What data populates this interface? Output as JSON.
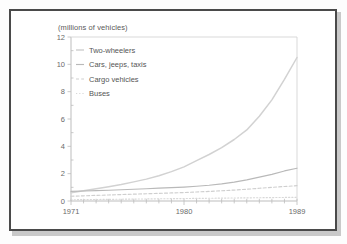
{
  "figure": {
    "title": "(millions of vehicles)",
    "frame_color": "#4a4a4a",
    "background": "#ffffff"
  },
  "legend": {
    "position": "top-left-inside",
    "items": [
      {
        "label": "Two-wheelers",
        "style": "solid",
        "color": "#d2d2d2"
      },
      {
        "label": "Cars, jeeps, taxis",
        "style": "solid",
        "color": "#b9b9b9"
      },
      {
        "label": "Cargo vehicles",
        "style": "dashed",
        "color": "#cfcfcf"
      },
      {
        "label": "Buses",
        "style": "dotted",
        "color": "#d8d8d8"
      }
    ]
  },
  "axes": {
    "y_ticks": [
      "0",
      "2",
      "4",
      "6",
      "8",
      "10",
      "12"
    ],
    "x_ticks": [
      "1971",
      "1980",
      "1989"
    ],
    "ylabel": "",
    "xlabel": ""
  },
  "chart_data": {
    "type": "line",
    "title": "(millions of vehicles)",
    "xlabel": "",
    "ylabel": "millions of vehicles",
    "xlim": [
      1971,
      1989
    ],
    "ylim": [
      0,
      12
    ],
    "yticks": [
      0,
      2,
      4,
      6,
      8,
      10,
      12
    ],
    "xticks": [
      1971,
      1980,
      1989
    ],
    "grid": false,
    "legend_position": "upper left",
    "x": [
      1971,
      1972,
      1973,
      1974,
      1975,
      1976,
      1977,
      1978,
      1979,
      1980,
      1981,
      1982,
      1983,
      1984,
      1985,
      1986,
      1987,
      1988,
      1989
    ],
    "series": [
      {
        "name": "Two-wheelers",
        "style": "solid",
        "values": [
          0.6,
          0.75,
          0.9,
          1.05,
          1.2,
          1.4,
          1.6,
          1.85,
          2.15,
          2.5,
          2.95,
          3.4,
          3.9,
          4.5,
          5.2,
          6.2,
          7.4,
          8.9,
          10.5
        ]
      },
      {
        "name": "Cars, jeeps, taxis",
        "style": "solid",
        "values": [
          0.7,
          0.73,
          0.76,
          0.79,
          0.82,
          0.86,
          0.9,
          0.94,
          0.98,
          1.02,
          1.08,
          1.15,
          1.25,
          1.38,
          1.55,
          1.75,
          1.95,
          2.2,
          2.4
        ]
      },
      {
        "name": "Cargo vehicles",
        "style": "dashed",
        "values": [
          0.35,
          0.38,
          0.41,
          0.44,
          0.47,
          0.5,
          0.53,
          0.56,
          0.59,
          0.62,
          0.66,
          0.7,
          0.75,
          0.8,
          0.86,
          0.93,
          1.0,
          1.06,
          1.12
        ]
      },
      {
        "name": "Buses",
        "style": "dotted",
        "values": [
          0.09,
          0.1,
          0.11,
          0.12,
          0.13,
          0.14,
          0.15,
          0.16,
          0.17,
          0.18,
          0.19,
          0.2,
          0.21,
          0.22,
          0.23,
          0.24,
          0.25,
          0.26,
          0.27
        ]
      }
    ]
  }
}
